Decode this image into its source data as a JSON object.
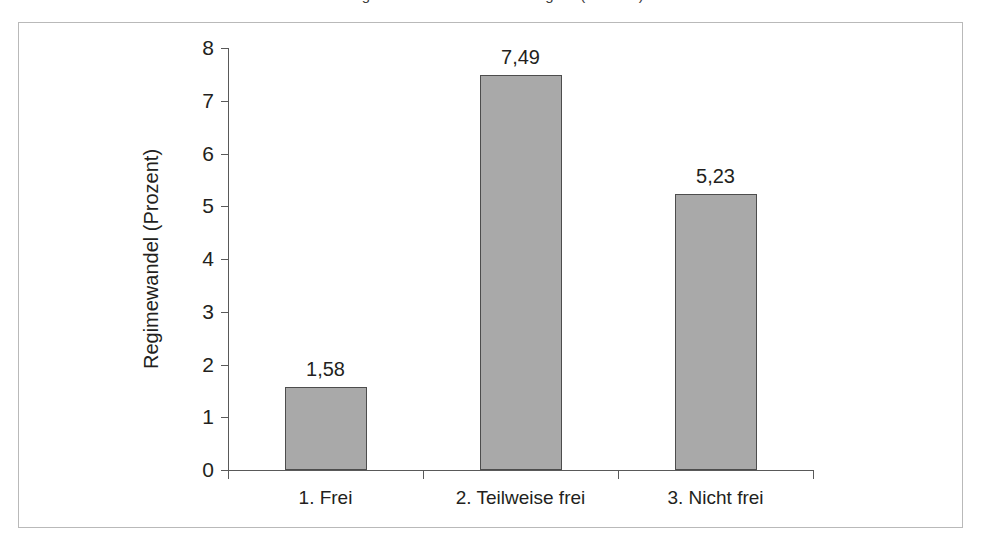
{
  "caption_sliver": "Regimewandel nach Freiheitsgrad (Prozent)",
  "chart_data": {
    "type": "bar",
    "title": "",
    "xlabel": "",
    "ylabel": "Regimewandel (Prozent)",
    "categories": [
      "1. Frei",
      "2. Teilweise frei",
      "3. Nicht frei"
    ],
    "values": [
      1.58,
      7.49,
      5.23
    ],
    "value_labels": [
      "1,58",
      "7,49",
      "5,23"
    ],
    "ylim": [
      0,
      8
    ],
    "ytick_labels": [
      "0",
      "1",
      "2",
      "3",
      "4",
      "5",
      "6",
      "7",
      "8"
    ],
    "ytick_values": [
      0,
      1,
      2,
      3,
      4,
      5,
      6,
      7,
      8
    ],
    "grid": false,
    "legend": false,
    "bar_fill_color": "#a9a9a9",
    "bar_border_color": "#4d4d4d",
    "axis_color": "#595959",
    "frame_color": "#b9b9b9",
    "text_color": "#231f20"
  }
}
